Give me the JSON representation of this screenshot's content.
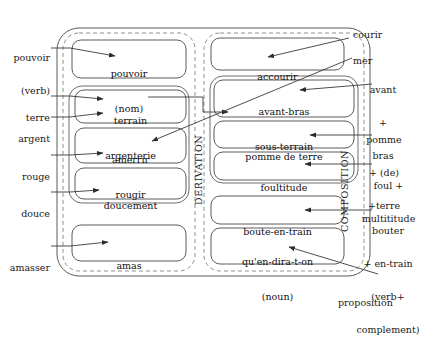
{
  "diagram": {
    "outer_container": "word-formation",
    "columns": [
      {
        "id": "derivation",
        "label": "DERIVATION"
      },
      {
        "id": "composition",
        "label": "COMPOSITION"
      }
    ]
  },
  "derivation": {
    "label": "DERIVATION",
    "boxes": [
      {
        "id": "pouvoir-nom",
        "lines": [
          "pouvoir",
          "(nom)"
        ]
      },
      {
        "id": "terrain-argenterie",
        "lines": [
          "terrain",
          "argenterie"
        ]
      },
      {
        "id": "amerrir-rougir",
        "lines": [
          "amerrir",
          "rougir"
        ]
      },
      {
        "id": "doucement",
        "lines": [
          "doucement"
        ]
      },
      {
        "id": "amas",
        "lines": [
          "amas"
        ]
      }
    ]
  },
  "composition": {
    "label": "COMPOSITION",
    "boxes": [
      {
        "id": "accourir",
        "lines": [
          "accourir"
        ]
      },
      {
        "id": "avant-bras-sous-terrain",
        "lines": [
          "avant-bras",
          "sous-terrain"
        ]
      },
      {
        "id": "pomme-de-terre",
        "lines": [
          "pomme de terre"
        ]
      },
      {
        "id": "foultitude",
        "lines": [
          "foultitude"
        ]
      },
      {
        "id": "boute-en-train",
        "lines": [
          "boute-en-train"
        ]
      },
      {
        "id": "quen-dira-t-on",
        "lines": [
          "qu'en-dira-t-on",
          "(noun)"
        ]
      }
    ]
  },
  "left_annotations": [
    {
      "id": "pouvoir-verb",
      "lines": [
        "pouvoir",
        "(verb)"
      ]
    },
    {
      "id": "terre",
      "lines": [
        "terre"
      ]
    },
    {
      "id": "argent",
      "lines": [
        "argent"
      ]
    },
    {
      "id": "rouge",
      "lines": [
        "rouge"
      ]
    },
    {
      "id": "douce",
      "lines": [
        "douce"
      ]
    },
    {
      "id": "amasser",
      "lines": [
        "amasser"
      ]
    }
  ],
  "right_annotations": [
    {
      "id": "courir",
      "lines": [
        "courir"
      ]
    },
    {
      "id": "mer",
      "lines": [
        "mer"
      ]
    },
    {
      "id": "avant-plus-bras",
      "lines": [
        "avant",
        "+",
        "bras"
      ]
    },
    {
      "id": "pomme-de-terre-formula",
      "lines": [
        "pomme",
        "+ (de)",
        "+terre"
      ]
    },
    {
      "id": "foul-multititude",
      "lines": [
        "foul +",
        "multititude"
      ]
    },
    {
      "id": "bouter-en-train",
      "lines": [
        "bouter",
        "+ en-train",
        "(verb+",
        "complement)"
      ]
    },
    {
      "id": "proposition",
      "lines": [
        "proposition"
      ]
    }
  ],
  "colors": {
    "stroke": "#4a4a4a",
    "dashed": "#8a8a8a",
    "text": "#1a1a1a",
    "background": "#ffffff"
  }
}
